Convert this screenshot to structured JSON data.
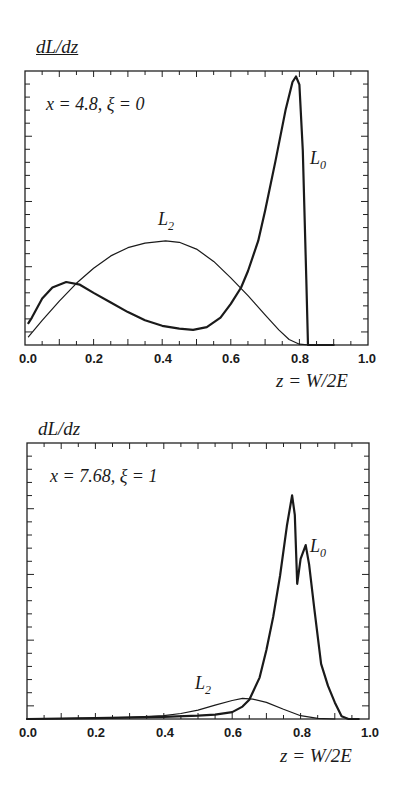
{
  "chart_data": [
    {
      "type": "line",
      "title": "",
      "annotation": "x = 4.8,  ξ = 0",
      "xlabel": "z = W/2E",
      "ylabel": "dL/dz",
      "xlim": [
        0.0,
        1.0
      ],
      "ylim": [
        0,
        1
      ],
      "x_ticks": [
        "0.0",
        "0.2",
        "0.4",
        "0.6",
        "0.8",
        "1.0"
      ],
      "y_ticks_labeled": false,
      "grid": false,
      "legend": "inline labels",
      "series": [
        {
          "name": "L0",
          "label_main": "L",
          "label_sub": "0",
          "stroke_width": 2.2,
          "x": [
            0.01,
            0.02,
            0.05,
            0.08,
            0.12,
            0.16,
            0.2,
            0.25,
            0.3,
            0.35,
            0.4,
            0.45,
            0.49,
            0.53,
            0.57,
            0.6,
            0.63,
            0.65,
            0.68,
            0.7,
            0.73,
            0.76,
            0.78,
            0.79,
            0.8,
            0.81,
            0.82,
            0.825,
            0.9
          ],
          "y": [
            0.08,
            0.1,
            0.17,
            0.21,
            0.23,
            0.22,
            0.19,
            0.155,
            0.12,
            0.09,
            0.07,
            0.06,
            0.055,
            0.065,
            0.1,
            0.15,
            0.21,
            0.27,
            0.38,
            0.49,
            0.67,
            0.86,
            0.96,
            0.98,
            0.95,
            0.71,
            0.24,
            0.0,
            0.0
          ]
        },
        {
          "name": "L2",
          "label_main": "L",
          "label_sub": "2",
          "stroke_width": 1.2,
          "x": [
            0.01,
            0.05,
            0.1,
            0.15,
            0.2,
            0.25,
            0.3,
            0.35,
            0.41,
            0.45,
            0.5,
            0.55,
            0.6,
            0.65,
            0.7,
            0.74,
            0.77,
            0.8,
            0.83
          ],
          "y": [
            0.03,
            0.09,
            0.16,
            0.225,
            0.28,
            0.325,
            0.355,
            0.372,
            0.38,
            0.375,
            0.35,
            0.305,
            0.245,
            0.18,
            0.11,
            0.055,
            0.02,
            0.003,
            0.0
          ]
        }
      ]
    },
    {
      "type": "line",
      "title": "",
      "annotation": "x = 7.68, ξ = 1",
      "xlabel": "z = W/2E",
      "ylabel": "dL/dz",
      "xlim": [
        0.0,
        1.0
      ],
      "ylim": [
        0,
        1
      ],
      "x_ticks": [
        "0.0",
        "0.2",
        "0.4",
        "0.6",
        "0.8",
        "1.0"
      ],
      "y_ticks_labeled": false,
      "grid": false,
      "legend": "inline labels",
      "series": [
        {
          "name": "L0",
          "label_main": "L",
          "label_sub": "0",
          "stroke_width": 2.2,
          "x": [
            0.0,
            0.2,
            0.4,
            0.5,
            0.55,
            0.6,
            0.63,
            0.65,
            0.68,
            0.7,
            0.72,
            0.74,
            0.76,
            0.775,
            0.783,
            0.79,
            0.8,
            0.815,
            0.825,
            0.84,
            0.86,
            0.88,
            0.9,
            0.92,
            0.94,
            0.97
          ],
          "y": [
            0.0,
            0.003,
            0.008,
            0.012,
            0.016,
            0.025,
            0.045,
            0.07,
            0.15,
            0.25,
            0.37,
            0.52,
            0.7,
            0.81,
            0.74,
            0.49,
            0.58,
            0.63,
            0.56,
            0.4,
            0.2,
            0.12,
            0.06,
            0.01,
            0.0,
            0.0
          ]
        },
        {
          "name": "L2",
          "label_main": "L",
          "label_sub": "2",
          "stroke_width": 1.2,
          "x": [
            0.0,
            0.2,
            0.3,
            0.4,
            0.45,
            0.5,
            0.55,
            0.6,
            0.63,
            0.66,
            0.7,
            0.75,
            0.8,
            0.85,
            0.9
          ],
          "y": [
            0.0,
            0.003,
            0.006,
            0.012,
            0.02,
            0.032,
            0.05,
            0.067,
            0.075,
            0.072,
            0.06,
            0.035,
            0.012,
            0.002,
            0.0
          ]
        }
      ]
    }
  ],
  "panels": [
    {
      "ylabel": "dL/dz",
      "annotation": "x = 4.8,  ξ = 0",
      "xlabel": "z = W/2E",
      "labels": {
        "L0_main": "L",
        "L0_sub": "0",
        "L2_main": "L",
        "L2_sub": "2"
      },
      "ticks": [
        "0.0",
        "0.2",
        "0.4",
        "0.6",
        "0.8",
        "1.0"
      ]
    },
    {
      "ylabel": "dL/dz",
      "annotation": "x = 7.68, ξ = 1",
      "xlabel": "z = W/2E",
      "labels": {
        "L0_main": "L",
        "L0_sub": "0",
        "L2_main": "L",
        "L2_sub": "2"
      },
      "ticks": [
        "0.0",
        "0.2",
        "0.4",
        "0.6",
        "0.8",
        "1.0"
      ]
    }
  ]
}
